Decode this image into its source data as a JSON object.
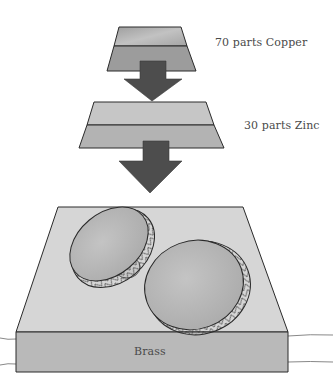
{
  "diagram": {
    "components": [
      {
        "label": "70 parts Copper",
        "color_top": "#a8a8a8",
        "color_bottom": "#9a9a9a"
      },
      {
        "label": "30 parts Zinc",
        "color_top": "#c4c4c4",
        "color_bottom": "#b2b2b2"
      }
    ],
    "result": {
      "label": "Brass",
      "top_color": "#d4d4d4",
      "front_color": "#b8b8b8"
    },
    "arrow_color": "#4d4d4d",
    "stroke_color": "#2a2a2a",
    "disc_color": "#b5b5b5"
  }
}
